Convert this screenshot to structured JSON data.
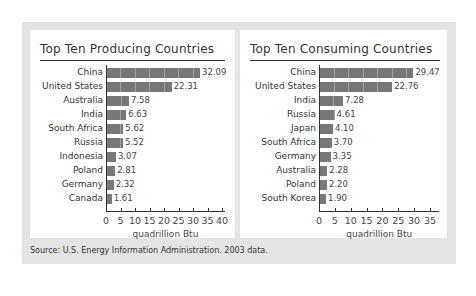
{
  "source_note": "Source: U.S. Energy Information Administration. 2003 data.",
  "chart_data": [
    {
      "type": "bar",
      "orientation": "horizontal",
      "title": "Top Ten Producing Countries",
      "categories": [
        "China",
        "United States",
        "Australia",
        "India",
        "South Africa",
        "Russia",
        "Indonesia",
        "Poland",
        "Germany",
        "Canada"
      ],
      "values": [
        32.09,
        22.31,
        7.58,
        6.63,
        5.62,
        5.52,
        3.07,
        2.81,
        2.32,
        1.61
      ],
      "value_labels": [
        "32.09",
        "22.31",
        "7.58",
        "6.63",
        "5.62",
        "5.52",
        "3.07",
        "2.81",
        "2.32",
        "1.61"
      ],
      "xlabel": "quadrillion Btu",
      "ylabel": "",
      "xlim": [
        0,
        41
      ],
      "xticks": [
        0,
        5,
        10,
        15,
        20,
        25,
        30,
        35,
        40
      ],
      "grid": false,
      "legend": null,
      "bar_color": "#787878"
    },
    {
      "type": "bar",
      "orientation": "horizontal",
      "title": "Top Ten Consuming Countries",
      "categories": [
        "China",
        "United States",
        "India",
        "Russia",
        "Japan",
        "South Africa",
        "Germany",
        "Australia",
        "Poland",
        "South Korea"
      ],
      "values": [
        29.47,
        22.76,
        7.28,
        4.61,
        4.1,
        3.7,
        3.35,
        2.28,
        2.2,
        1.9
      ],
      "value_labels": [
        "29.47",
        "22.76",
        "7.28",
        "4.61",
        "4.10",
        "3.70",
        "3.35",
        "2.28",
        "2.20",
        "1.90"
      ],
      "xlabel": "quadrillion Btu",
      "ylabel": "",
      "xlim": [
        0,
        38
      ],
      "xticks": [
        0,
        5,
        10,
        15,
        20,
        25,
        30,
        35
      ],
      "grid": false,
      "legend": null,
      "bar_color": "#787878"
    }
  ]
}
